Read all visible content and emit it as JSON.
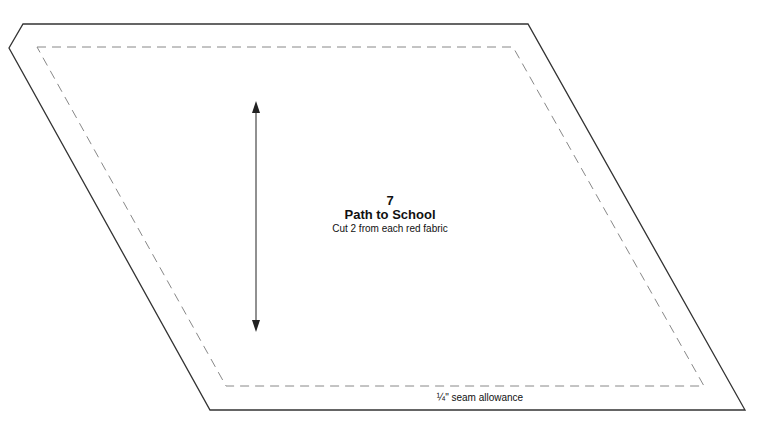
{
  "pattern_piece": {
    "number": "7",
    "name": "Path to School",
    "instruction": "Cut 2 from each red fabric",
    "seam_label": "¼\" seam allowance"
  },
  "colors": {
    "cut_line": "#333333",
    "seam_line": "#888888",
    "grain_arrow": "#222222"
  }
}
